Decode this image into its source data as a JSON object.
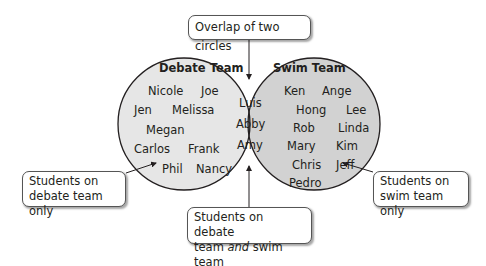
{
  "colors": {
    "debate_fill": "#e6e6e6",
    "swim_fill": "#d2d2d2",
    "overlap_fill": "#a9a9a9",
    "stroke": "#231f20"
  },
  "debate": {
    "title": "Debate Team",
    "members": [
      "Nicole",
      "Joe",
      "Jen",
      "Melissa",
      "Megan",
      "Carlos",
      "Frank",
      "Phil",
      "Nancy"
    ]
  },
  "swim": {
    "title": "Swim Team",
    "members": [
      "Ken",
      "Ange",
      "Hong",
      "Lee",
      "Rob",
      "Linda",
      "Mary",
      "Kim",
      "Chris",
      "Jeff",
      "Pedro"
    ]
  },
  "both": {
    "members": [
      "Luis",
      "Abby",
      "Amy"
    ]
  },
  "callouts": {
    "overlap": "Overlap of two circles",
    "debate_only_line1": "Students on",
    "debate_only_line2": "debate team only",
    "swim_only_line1": "Students on",
    "swim_only_line2": "swim team only",
    "both_line1": "Students on debate",
    "both_line2_pre": "team ",
    "both_line2_em": "and",
    "both_line2_post": " swim team"
  }
}
